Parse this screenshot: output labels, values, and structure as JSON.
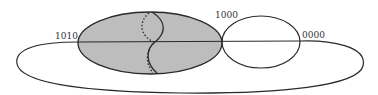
{
  "diagram": {
    "labels": {
      "left": "1010",
      "middle": "1000",
      "right": "0000"
    },
    "colors": {
      "stroke": "#2a2a2a",
      "shaded_fill": "#bdbdbd",
      "background": "#ffffff"
    }
  }
}
